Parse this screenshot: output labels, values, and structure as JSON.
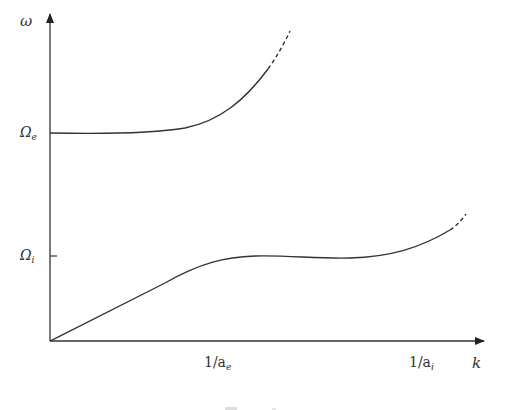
{
  "diagram": {
    "type": "dispersion-relation-sketch",
    "axes": {
      "y_label": "ω",
      "x_label": "k",
      "y_ticks": [
        {
          "symbol": "Ω",
          "subscript": "e",
          "y_px": 133
        },
        {
          "symbol": "Ω",
          "subscript": "i",
          "y_px": 256
        }
      ],
      "x_ticks": [
        {
          "text": "1/a",
          "subscript": "e",
          "x_px": 218
        },
        {
          "text": "1/a",
          "subscript": "i",
          "x_px": 424
        }
      ]
    },
    "curves": [
      {
        "name": "upper-branch",
        "starts_at": "Ω_e",
        "style": "solid then dashed"
      },
      {
        "name": "lower-branch",
        "starts_at": "origin",
        "style": "linear rise, plateau near Ω_i, then rising dashed"
      }
    ],
    "colors": {
      "ink": "#333333",
      "background": "#ffffff"
    }
  }
}
